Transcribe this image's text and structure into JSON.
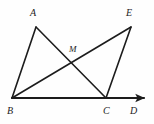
{
  "figure": {
    "kind": "geometry-diagram",
    "canvas": {
      "width": 154,
      "height": 124
    },
    "background_color": "#fefefe",
    "stroke_color": "#1c1c1c",
    "points": [
      {
        "name": "A",
        "label": "A",
        "x": 36,
        "y": 27,
        "label_x": 30,
        "label_y": 8
      },
      {
        "name": "E",
        "label": "E",
        "x": 131,
        "y": 27,
        "label_x": 126,
        "label_y": 8
      },
      {
        "name": "M",
        "label": "M",
        "x": 72,
        "y": 57,
        "label_x": 69,
        "label_y": 44
      },
      {
        "name": "B",
        "label": "B",
        "x": 12,
        "y": 98,
        "label_x": 7,
        "label_y": 106
      },
      {
        "name": "C",
        "label": "C",
        "x": 106,
        "y": 98,
        "label_x": 103,
        "label_y": 106
      },
      {
        "name": "D",
        "label": "D",
        "x": 148,
        "y": 98,
        "label_x": 130,
        "label_y": 106
      }
    ],
    "segments": [
      {
        "name": "AB",
        "from": "A",
        "to": "B",
        "width": 1.6
      },
      {
        "name": "AC",
        "from": "A",
        "to": "C",
        "width": 1.6
      },
      {
        "name": "BE",
        "from": "B",
        "to": "E",
        "width": 1.6
      },
      {
        "name": "CE",
        "from": "C",
        "to": "E",
        "width": 1.6
      }
    ],
    "rays": [
      {
        "name": "BD",
        "from": "B",
        "to": "D",
        "width": 2.1,
        "arrow_at": "D"
      }
    ]
  }
}
